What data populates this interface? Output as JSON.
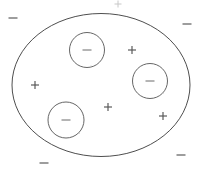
{
  "diagram": {
    "background_color": "#ffffff",
    "outline_color": "#3a3a3a",
    "sign_color": "#555555",
    "boundary": {
      "name": "outer-ellipse",
      "shape": "ellipse",
      "cx": 101,
      "cy": 85,
      "rx": 89,
      "ry": 71.5
    },
    "inner_circles": [
      {
        "label": "−",
        "cx": 87,
        "cy": 50,
        "r": 17.5
      },
      {
        "label": "−",
        "cx": 150,
        "cy": 81,
        "r": 17.5
      },
      {
        "label": "−",
        "cx": 66,
        "cy": 120,
        "r": 18
      }
    ],
    "inside_charges": [
      {
        "label": "+",
        "x": 35,
        "y": 85
      },
      {
        "label": "+",
        "x": 132,
        "y": 50
      },
      {
        "label": "+",
        "x": 108,
        "y": 107
      },
      {
        "label": "+",
        "x": 163,
        "y": 116
      }
    ],
    "outside_charges": [
      {
        "label": "−",
        "x": 13,
        "y": 18
      },
      {
        "label": "−",
        "x": 187,
        "y": 24
      },
      {
        "label": "−",
        "x": 181,
        "y": 155
      },
      {
        "label": "−",
        "x": 44,
        "y": 163
      }
    ],
    "faint_marks": [
      {
        "label": "+",
        "x": 118,
        "y": 4
      }
    ],
    "counts": {
      "inner_circles": 3,
      "inside_plus": 4,
      "outside_minus": 4
    }
  }
}
